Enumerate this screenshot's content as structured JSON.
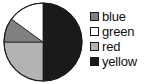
{
  "chart_data": {
    "type": "pie",
    "title": "",
    "labels": [
      "blue",
      "green",
      "red",
      "yellow"
    ],
    "values": [
      10,
      15,
      25,
      50
    ],
    "units": "percent",
    "colors": [
      "#808080",
      "#ffffff",
      "#b3b3b3",
      "#1a1a1a"
    ],
    "slice_angles_deg": [
      38,
      52,
      90,
      180
    ],
    "start_angle_deg": 90,
    "direction": "clockwise",
    "legend_position": "right",
    "grid": false,
    "slices": [
      {
        "label": "blue",
        "value": 10,
        "angle_deg": 38,
        "color": "#808080"
      },
      {
        "label": "green",
        "value": 15,
        "angle_deg": 52,
        "color": "#ffffff"
      },
      {
        "label": "red",
        "value": 25,
        "angle_deg": 90,
        "color": "#b3b3b3"
      },
      {
        "label": "yellow",
        "value": 50,
        "angle_deg": 180,
        "color": "#1a1a1a"
      }
    ]
  },
  "legend": {
    "items": [
      {
        "label": "blue",
        "swatch": "#808080"
      },
      {
        "label": "green",
        "swatch": "#ffffff"
      },
      {
        "label": "red",
        "swatch": "#b3b3b3"
      },
      {
        "label": "yellow",
        "swatch": "#1a1a1a"
      }
    ]
  },
  "style": {
    "outline": "#1a1a1a",
    "background": "#ffffff"
  }
}
